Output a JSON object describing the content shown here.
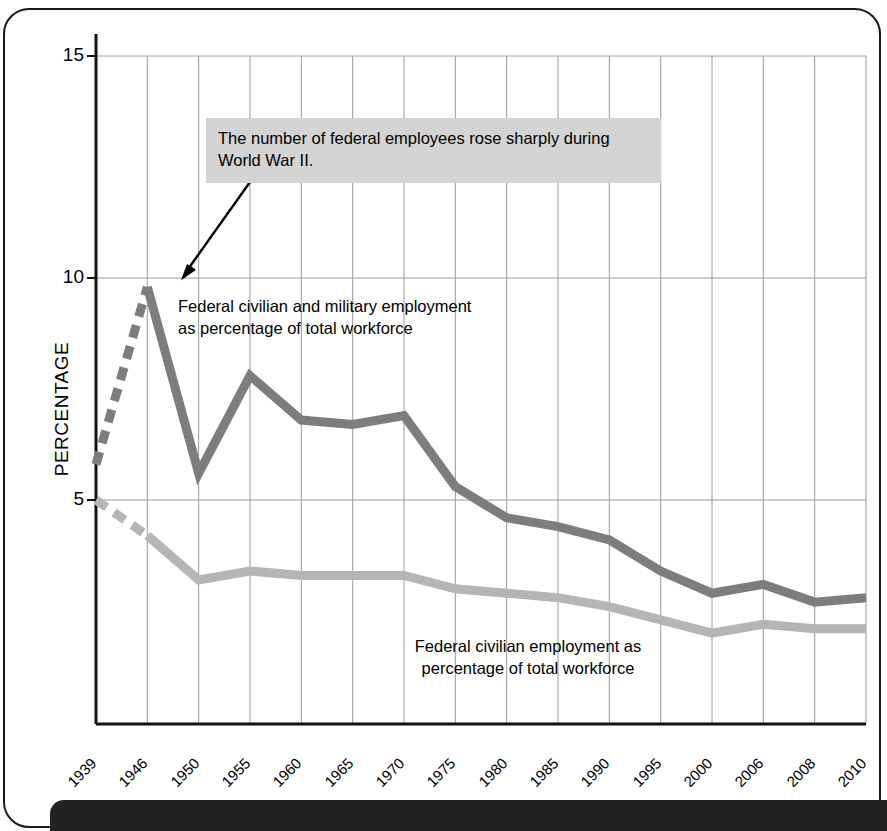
{
  "page": {
    "banner_text": "",
    "border_color": "#1a1a1a"
  },
  "axes": {
    "ylabel": "PERCENTAGE",
    "yticks": [
      "15",
      "10",
      "5"
    ],
    "xticks": [
      "1939",
      "1946",
      "1950",
      "1955",
      "1960",
      "1965",
      "1970",
      "1975",
      "1980",
      "1985",
      "1990",
      "1995",
      "2000",
      "2006",
      "2008",
      "2010"
    ]
  },
  "annotation": {
    "callout_line1": "The number of federal employees rose sharply during",
    "callout_line2": "World War II.",
    "callout_bg": "#d4d4d4"
  },
  "labels": {
    "dark_series_line1": "Federal civilian and military employment",
    "dark_series_line2": "as percentage of total workforce",
    "light_series_line1": "Federal civilian employment as",
    "light_series_line2": "percentage of total workforce"
  },
  "chart_data": {
    "type": "line",
    "title": "",
    "xlabel": "",
    "ylabel": "PERCENTAGE",
    "ylim": [
      0,
      15
    ],
    "yticks": [
      5,
      10,
      15
    ],
    "grid": true,
    "legend": "inline-annotations",
    "categories": [
      "1939",
      "1946",
      "1950",
      "1955",
      "1960",
      "1965",
      "1970",
      "1975",
      "1980",
      "1985",
      "1990",
      "1995",
      "2000",
      "2006",
      "2008",
      "2010"
    ],
    "series": [
      {
        "name": "Federal civilian and military employment as percentage of total workforce",
        "color": "#7d7d7d",
        "dashed_segment": [
          "1939",
          "1946"
        ],
        "values": [
          5.8,
          9.8,
          5.6,
          7.8,
          6.8,
          6.7,
          6.9,
          5.3,
          4.6,
          4.4,
          4.1,
          3.4,
          2.9,
          3.1,
          2.7,
          2.8
        ]
      },
      {
        "name": "Federal civilian employment as percentage of total workforce",
        "color": "#b5b5b5",
        "dashed_segment": [
          "1939",
          "1946"
        ],
        "values": [
          5.0,
          4.2,
          3.2,
          3.4,
          3.3,
          3.3,
          3.3,
          3.0,
          2.9,
          2.8,
          2.6,
          2.3,
          2.0,
          2.2,
          2.1,
          2.1
        ]
      }
    ],
    "annotations": [
      {
        "text": "The number of federal employees rose sharply during World War II.",
        "points_to": {
          "x": "1946",
          "y": 9.8
        }
      }
    ]
  }
}
